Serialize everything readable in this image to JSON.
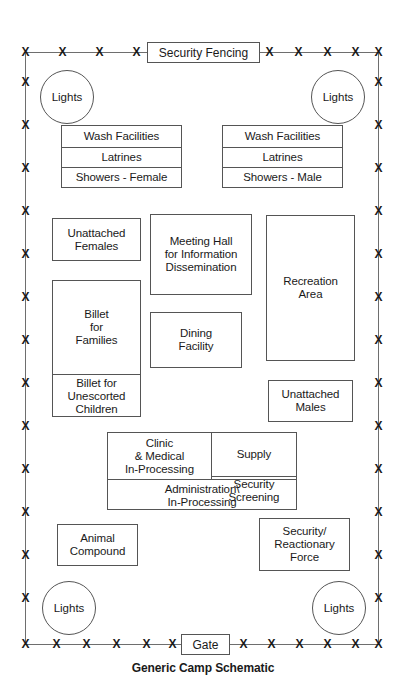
{
  "diagram": {
    "caption": "Generic Camp Schematic",
    "fence": {
      "top_label": "Security Fencing",
      "bottom_label": "Gate",
      "post_marker": "X",
      "line_color": "#6e6e6e",
      "top_posts_left": 5,
      "top_posts_right": 5,
      "bottom_posts_left": 6,
      "bottom_posts_right": 6,
      "side_posts": 7
    },
    "lights": {
      "label": "Lights",
      "count": 4,
      "positions": [
        "top-left",
        "top-right",
        "bottom-left",
        "bottom-right"
      ]
    },
    "facilities": {
      "wash_female": {
        "rows": [
          "Wash Facilities",
          "Latrines",
          "Showers - Female"
        ]
      },
      "wash_male": {
        "rows": [
          "Wash Facilities",
          "Latrines",
          "Showers - Male"
        ]
      },
      "unattached_females": "Unattached\nFemales",
      "unattached_males": "Unattached\nMales",
      "meeting_hall": "Meeting Hall\nfor Information\nDissemination",
      "dining_facility": "Dining\nFacility",
      "recreation_area": "Recreation\nArea",
      "billet": {
        "rows": [
          "Billet\nfor\nFamilies",
          "Billet for\nUnescorted\nChildren"
        ]
      },
      "processing_block": {
        "clinic": "Clinic\n& Medical\nIn-Processing",
        "supply": "Supply",
        "security_screening": "Security\nScreening",
        "administration": "Administration\\\nIn-Processing"
      },
      "animal_compound": "Animal\nCompound",
      "security_reactionary_force": "Security/\nReactionary\nForce"
    }
  }
}
